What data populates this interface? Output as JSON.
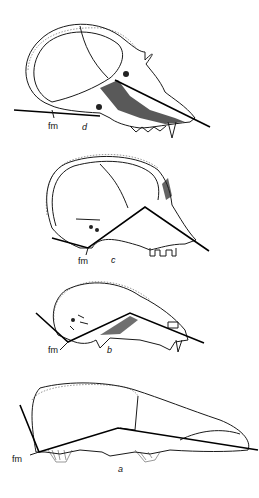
{
  "figure": {
    "panels": [
      {
        "id": "d",
        "label": "d",
        "fm_label": "fm"
      },
      {
        "id": "c",
        "label": "c",
        "fm_label": "fm"
      },
      {
        "id": "b",
        "label": "b",
        "fm_label": "fm"
      },
      {
        "id": "a",
        "label": "a",
        "fm_label": "fm"
      }
    ]
  }
}
